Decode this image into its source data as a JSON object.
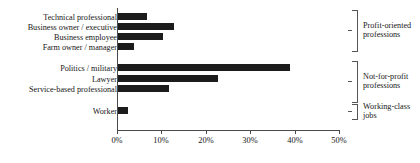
{
  "chart_data": {
    "type": "bar",
    "orientation": "horizontal",
    "title": "",
    "xlabel": "",
    "ylabel": "",
    "xlim": [
      0,
      50
    ],
    "xtick_labels": [
      "0%",
      "10%",
      "20%",
      "30%",
      "40%",
      "50%"
    ],
    "xticks": [
      0,
      10,
      20,
      30,
      40,
      50
    ],
    "grid": false,
    "legend": "none",
    "bar_color": "#1c1c1c",
    "categories": [
      "Technical professional",
      "Business owner / executive",
      "Business employee",
      "Farm owner / manager",
      "Politics / military",
      "Lawyer",
      "Service-based professional",
      "Worker"
    ],
    "values": [
      6.5,
      12.5,
      10.0,
      3.5,
      38.5,
      22.5,
      11.5,
      2.2
    ],
    "groups": [
      {
        "label_line1": "Profit-oriented",
        "label_line2": "professions",
        "members": [
          "Technical professional",
          "Business owner / executive",
          "Business employee",
          "Farm owner / manager"
        ]
      },
      {
        "label_line1": "Not-for-profit",
        "label_line2": "professions",
        "members": [
          "Politics / military",
          "Lawyer",
          "Service-based professional"
        ]
      },
      {
        "label_line1": "Working-class",
        "label_line2": "jobs",
        "members": [
          "Worker"
        ]
      }
    ]
  }
}
